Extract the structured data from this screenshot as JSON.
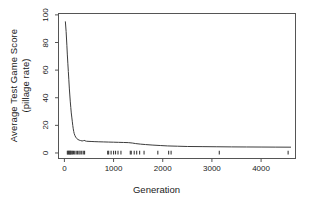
{
  "figure": {
    "background_color": "#ffffff",
    "line_color": "#3c3c3c",
    "axis_color": "#555555",
    "text_color": "#1a1a1a"
  },
  "axis_titles": {
    "y_line1": "Average Test Game Score",
    "y_line2": "(pillage rate)",
    "x": "Generation"
  },
  "chart_data": {
    "type": "line",
    "title": "",
    "subtitle": "",
    "xlabel": "Generation",
    "ylabel": "Average Test Game Score (pillage rate)",
    "xlim": [
      -120,
      4700
    ],
    "ylim": [
      -4,
      101
    ],
    "xticks": [
      0,
      1000,
      2000,
      3000,
      4000
    ],
    "xticklabels": [
      "0",
      "1000",
      "2000",
      "3000",
      "4000"
    ],
    "yticks": [
      0,
      20,
      40,
      60,
      80,
      100
    ],
    "yticklabels": [
      "0",
      "20",
      "40",
      "60",
      "80",
      "100"
    ],
    "grid": false,
    "legend": null,
    "legend_position": "none",
    "series": [
      {
        "name": "Average test game score",
        "x": [
          20,
          35,
          50,
          60,
          70,
          80,
          90,
          100,
          110,
          120,
          130,
          140,
          150,
          160,
          170,
          180,
          190,
          200,
          215,
          230,
          250,
          275,
          300,
          330,
          360,
          385,
          400,
          420,
          450,
          500,
          560,
          620,
          700,
          800,
          900,
          1000,
          1100,
          1200,
          1300,
          1380,
          1450,
          1550,
          1650,
          1800,
          1950,
          2100,
          2300,
          2500,
          2800,
          3100,
          3400,
          3700,
          4000,
          4300,
          4600
        ],
        "y": [
          95,
          88,
          78,
          71,
          65,
          59,
          53,
          47,
          42,
          37,
          33,
          29,
          26,
          23,
          20,
          17.5,
          15.5,
          14,
          12.5,
          11.5,
          10.5,
          9.8,
          9.3,
          9.0,
          8.7,
          8.9,
          9.2,
          8.8,
          8.5,
          8.4,
          8.3,
          8.2,
          8.1,
          8.0,
          7.9,
          7.8,
          7.7,
          7.6,
          7.5,
          7.2,
          6.8,
          6.4,
          6.1,
          5.7,
          5.4,
          5.1,
          4.9,
          4.7,
          4.6,
          4.5,
          4.4,
          4.35,
          4.3,
          4.25,
          4.2
        ]
      }
    ],
    "rug_marks": {
      "description": "tick marks along baseline at y=0",
      "y_value": 0,
      "x": [
        60,
        72,
        84,
        96,
        108,
        120,
        132,
        150,
        168,
        186,
        210,
        240,
        268,
        296,
        320,
        352,
        384,
        410,
        880,
        900,
        950,
        1000,
        1040,
        1090,
        1150,
        1340,
        1360,
        1420,
        1470,
        1530,
        1620,
        1900,
        2120,
        2170,
        3150,
        4550
      ]
    }
  }
}
